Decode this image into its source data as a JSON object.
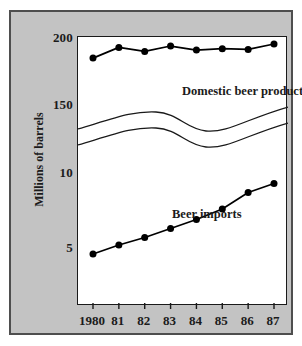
{
  "chart_data": {
    "type": "line",
    "title": "",
    "xlabel": "",
    "ylabel": "Millions of barrels",
    "x": [
      1980,
      1981,
      1982,
      1983,
      1984,
      1985,
      1986,
      1987
    ],
    "xtick_labels": [
      "1980",
      "81",
      "82",
      "83",
      "84",
      "85",
      "86",
      "87"
    ],
    "broken_axis": true,
    "axis_break_style": "wavy-double-line",
    "upper_scale": {
      "ytick_labels": [
        "200",
        "150"
      ],
      "ytick_values": [
        200,
        150
      ]
    },
    "lower_scale": {
      "ytick_labels": [
        "10",
        "5"
      ],
      "ytick_values": [
        10,
        5
      ]
    },
    "grid": false,
    "legend_position": "inline-annotation",
    "series": [
      {
        "name": "Domestic beer production",
        "scale": "upper",
        "units": "millions of barrels",
        "marker": "filled-circle",
        "values": [
          185.0,
          193.0,
          190.0,
          194.0,
          191.0,
          192.0,
          191.5,
          195.5
        ]
      },
      {
        "name": "Beer imports",
        "scale": "lower",
        "units": "millions of barrels",
        "marker": "filled-circle",
        "values": [
          4.6,
          5.2,
          5.7,
          6.3,
          6.9,
          7.6,
          8.7,
          9.3
        ]
      }
    ]
  },
  "annotations": {
    "domestic_label": "Domestic beer production",
    "imports_label": "Beer imports"
  },
  "colors": {
    "panel_background": "#c3c3c3",
    "plot_background": "#ffffff",
    "frame": "#4e4e4e",
    "axis": "#1a1a1a",
    "series": "#000000",
    "text": "#1b1b1b"
  }
}
